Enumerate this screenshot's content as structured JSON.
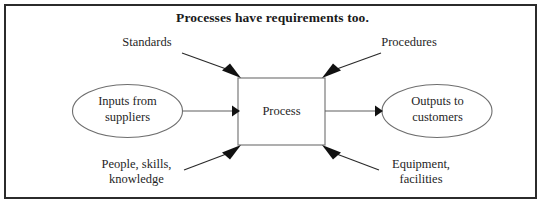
{
  "diagram": {
    "title": "Processes have requirements too.",
    "type": "process-flow",
    "nodes": [
      {
        "id": "input",
        "shape": "ellipse",
        "lines": [
          "Inputs from",
          "suppliers"
        ]
      },
      {
        "id": "process",
        "shape": "rectangle",
        "lines": [
          "Process"
        ]
      },
      {
        "id": "output",
        "shape": "ellipse",
        "lines": [
          "Outputs to",
          "customers"
        ]
      }
    ],
    "annotations": [
      {
        "id": "standards",
        "position": "top-left",
        "lines": [
          "Standards"
        ]
      },
      {
        "id": "procedures",
        "position": "top-right",
        "lines": [
          "Procedures"
        ]
      },
      {
        "id": "people",
        "position": "bottom-left",
        "lines": [
          "People, skills,",
          "knowledge"
        ]
      },
      {
        "id": "equipment",
        "position": "bottom-right",
        "lines": [
          "Equipment,",
          "facilities"
        ]
      }
    ],
    "connections": [
      {
        "from": "input",
        "to": "process",
        "style": "arrow"
      },
      {
        "from": "process",
        "to": "output",
        "style": "arrow"
      },
      {
        "from": "standards",
        "to": "process",
        "style": "arrow"
      },
      {
        "from": "procedures",
        "to": "process",
        "style": "arrow"
      },
      {
        "from": "people",
        "to": "process",
        "style": "arrow"
      },
      {
        "from": "equipment",
        "to": "process",
        "style": "arrow"
      }
    ],
    "colors": {
      "frame": "#2b2b2b",
      "shape_stroke": "#7a7a7a",
      "arrow": "#111111",
      "text": "#1f1f1f",
      "background": "#ffffff"
    }
  }
}
